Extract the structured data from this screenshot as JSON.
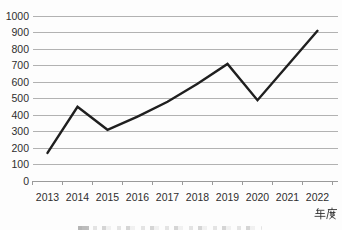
{
  "chart_data": {
    "type": "line",
    "title": "",
    "categories": [
      "2013",
      "2014",
      "2015",
      "2016",
      "2017",
      "2018",
      "2019",
      "2020",
      "2021",
      "2022"
    ],
    "values": [
      170,
      450,
      310,
      390,
      480,
      590,
      710,
      490,
      700,
      910
    ],
    "xlabel": "年度",
    "ylabel": "",
    "ylim": [
      0,
      1000
    ],
    "ytick_step": 100,
    "grid": true,
    "legend": "none",
    "line_color": "#1f1f1f",
    "grid_color": "#b2b2b2",
    "axis_color": "#9a9a9a",
    "tick_label_color": "#2e2e2e"
  }
}
